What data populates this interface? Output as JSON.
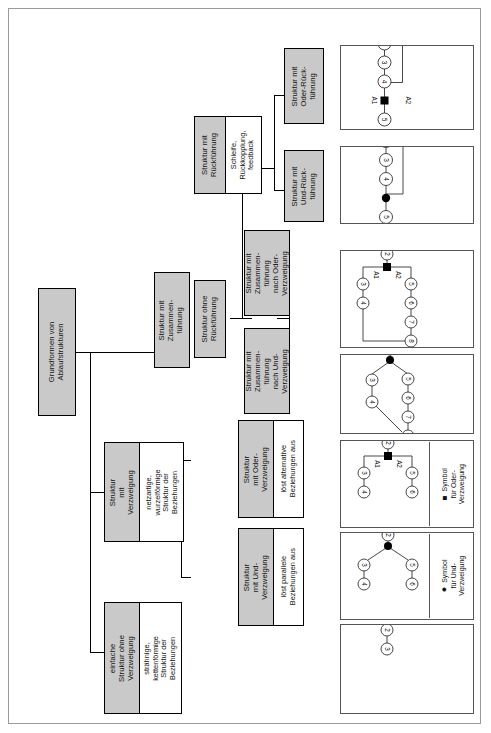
{
  "diagram": {
    "title": "Grundformen von Ablaufstrukturen",
    "root": {
      "label": "Grundformen von\nAblaufstrukturen"
    },
    "nodes": {
      "struktur_ohne_verzweigung": {
        "label": "einfache\nStruktur ohne\nVerzweigung",
        "description": "strähnige,\nkettenförmige\nStruktur der\nBeziehungen"
      },
      "struktur_mit_verzweigung": {
        "label": "Struktur\nmit\nVerzweigung",
        "description": "netzartige,\nwurzelförmige\nStruktur der\nBeziehungen"
      },
      "struktur_mit_und_verzweigung": {
        "label": "Struktur\nmit Und-\nVerzweigung",
        "description": "löst parallele\nBeziehungen aus"
      },
      "struktur_mit_oder_verzweigung": {
        "label": "Struktur\nmit Oder-\nVerzweigung",
        "description": "löst alternative\nBeziehungen aus"
      },
      "struktur_mit_zusammenfuehrung": {
        "label": "Struktur mit\nZusammen-\nführung"
      },
      "struktur_ohne_rueckfuehrung": {
        "label": "Struktur ohne\nRückführung"
      },
      "struktur_mit_rueckfuehrung": {
        "label": "Struktur mit\nRückführung",
        "description": "Schleife,\nRückkopplung,\nfeedback"
      },
      "zusammenfuehrung_nach_und": {
        "label": "Struktur mit\nZusammen-\nführung\nnach Und-\nVerzweigung"
      },
      "zusammenfuehrung_nach_oder": {
        "label": "Struktur mit\nZusammen-\nführung\nnach Oder-\nVerzweigung"
      },
      "struktur_mit_und_rueckfuehrung": {
        "label": "Struktur mit\nUnd-Rück-\nführung"
      },
      "struktur_mit_oder_rueckfuehrung": {
        "label": "Struktur mit\nOder-Rück-\nführung"
      }
    },
    "panels": {
      "oder_rueckfuehrung": {
        "name": "Struktur mit Oder-Rückführung",
        "node_labels": [
          "1",
          "2",
          "3",
          "4",
          "5",
          "6"
        ],
        "loop_label": "R",
        "branch_labels": [
          "A1",
          "A2"
        ],
        "branch_symbol": "square"
      },
      "und_rueckfuehrung": {
        "name": "Struktur mit Und-Rückführung",
        "node_labels": [
          "1",
          "2",
          "3",
          "4",
          "5",
          "6"
        ],
        "loop_label": "R",
        "branch_symbol": "circle"
      },
      "zusammenfuehrung_oder": {
        "name": "Struktur mit Zusammenführung nach Oder-Verzweigung",
        "node_labels": [
          "1",
          "2",
          "3",
          "4",
          "5",
          "6",
          "7",
          "8"
        ],
        "branch_labels": [
          "A1",
          "A2"
        ],
        "branch_symbol": "square"
      },
      "zusammenfuehrung_und": {
        "name": "Struktur mit Zusammenführung nach Und-Verzweigung",
        "node_labels": [
          "1",
          "2",
          "3",
          "4",
          "5",
          "6",
          "7",
          "8"
        ],
        "branch_symbol": "circle"
      },
      "oder_verzweigung": {
        "name": "Struktur mit Oder-Verzweigung",
        "node_labels": [
          "1",
          "2",
          "3",
          "4",
          "5",
          "6"
        ],
        "branch_labels": [
          "A1",
          "A2"
        ],
        "branch_symbol": "square",
        "legend": "Symbol\nfür Oder-\nVerzweigung"
      },
      "und_verzweigung": {
        "name": "Struktur mit Und-Verzweigung",
        "node_labels": [
          "1",
          "2",
          "3",
          "4",
          "5",
          "6"
        ],
        "branch_symbol": "circle",
        "legend": "Symbol\nfür Und-\nVerzweigung"
      },
      "ohne_verzweigung": {
        "name": "einfache Struktur ohne Verzweigung",
        "node_labels": [
          "1",
          "2",
          "3"
        ]
      }
    },
    "colors": {
      "node_fill": "#c9c9c9",
      "desc_fill": "#ffffff",
      "border": "#000000",
      "panel_border": "#555555"
    }
  }
}
